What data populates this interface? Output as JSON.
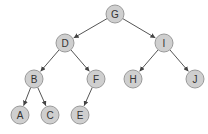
{
  "diagram": {
    "type": "binary-tree",
    "node_radius": 9,
    "colors": {
      "node_fill": "#cfcfcf",
      "node_stroke": "#9a9a9a",
      "edge": "#555555",
      "label": "#333333"
    },
    "nodes": [
      {
        "id": "G",
        "label": "G",
        "x": 115,
        "y": 14
      },
      {
        "id": "D",
        "label": "D",
        "x": 65,
        "y": 43
      },
      {
        "id": "I",
        "label": "I",
        "x": 164,
        "y": 43
      },
      {
        "id": "B",
        "label": "B",
        "x": 34,
        "y": 79
      },
      {
        "id": "F",
        "label": "F",
        "x": 96,
        "y": 79
      },
      {
        "id": "H",
        "label": "H",
        "x": 133,
        "y": 79
      },
      {
        "id": "J",
        "label": "J",
        "x": 195,
        "y": 79
      },
      {
        "id": "A",
        "label": "A",
        "x": 20,
        "y": 115
      },
      {
        "id": "C",
        "label": "C",
        "x": 50,
        "y": 115
      },
      {
        "id": "E",
        "label": "E",
        "x": 80,
        "y": 115
      }
    ],
    "edges": [
      {
        "from": "G",
        "to": "D"
      },
      {
        "from": "G",
        "to": "I"
      },
      {
        "from": "D",
        "to": "B"
      },
      {
        "from": "D",
        "to": "F"
      },
      {
        "from": "I",
        "to": "H"
      },
      {
        "from": "I",
        "to": "J"
      },
      {
        "from": "B",
        "to": "A"
      },
      {
        "from": "B",
        "to": "C"
      },
      {
        "from": "F",
        "to": "E"
      }
    ]
  }
}
